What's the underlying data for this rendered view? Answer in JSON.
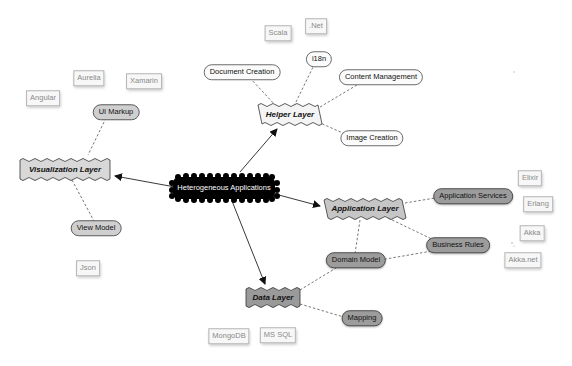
{
  "diagram": {
    "type": "mind-map",
    "center": {
      "label": "Heterogeneous Applications",
      "fill": "#000000",
      "text_color": "#ffffff"
    },
    "layers": [
      {
        "id": "helper",
        "label": "Helper Layer",
        "fill": "#f4f4f4"
      },
      {
        "id": "visualization",
        "label": "Visualization Layer",
        "fill": "#d8d8d8"
      },
      {
        "id": "application",
        "label": "Application Layer",
        "fill": "#c6c6c6"
      },
      {
        "id": "data",
        "label": "Data Layer",
        "fill": "#9a9a9a"
      }
    ],
    "concepts": {
      "document_creation": "Document Creation",
      "i18n": "i18n",
      "content_management": "Content Management",
      "image_creation": "Image Creation",
      "ui_markup": "UI Markup",
      "view_model": "View Model",
      "application_services": "Application Services",
      "business_rules": "Business Rules",
      "domain_model": "Domain Model",
      "mapping": "Mapping"
    },
    "technologies": {
      "scala": "Scala",
      "net": ".Net",
      "aurelia": "Aurelia",
      "xamarin": "Xamarin",
      "angular": "Angular",
      "json": "Json",
      "elixir": "Elixir",
      "erlang": "Erlang",
      "akka": "Akka",
      "akka_net": "Akka.net",
      "mongodb": "MongoDB",
      "ms_sql": "MS SQL"
    },
    "edges": [
      {
        "from": "Heterogeneous Applications",
        "to": "Helper Layer",
        "style": "solid-arrow"
      },
      {
        "from": "Heterogeneous Applications",
        "to": "Visualization Layer",
        "style": "solid-arrow"
      },
      {
        "from": "Heterogeneous Applications",
        "to": "Application Layer",
        "style": "solid-arrow"
      },
      {
        "from": "Heterogeneous Applications",
        "to": "Data Layer",
        "style": "solid-arrow"
      },
      {
        "from": "Helper Layer",
        "to": "Document Creation",
        "style": "dashed"
      },
      {
        "from": "Helper Layer",
        "to": "i18n",
        "style": "dashed"
      },
      {
        "from": "Helper Layer",
        "to": "Content Management",
        "style": "dashed"
      },
      {
        "from": "Helper Layer",
        "to": "Image Creation",
        "style": "dashed"
      },
      {
        "from": "Visualization Layer",
        "to": "UI Markup",
        "style": "dashed"
      },
      {
        "from": "Visualization Layer",
        "to": "View Model",
        "style": "dashed"
      },
      {
        "from": "Application Layer",
        "to": "Application Services",
        "style": "dashed"
      },
      {
        "from": "Application Layer",
        "to": "Business Rules",
        "style": "dashed"
      },
      {
        "from": "Application Layer",
        "to": "Domain Model",
        "style": "dashed"
      },
      {
        "from": "Domain Model",
        "to": "Business Rules",
        "style": "dashed"
      },
      {
        "from": "Data Layer",
        "to": "Domain Model",
        "style": "dashed"
      },
      {
        "from": "Data Layer",
        "to": "Mapping",
        "style": "dashed"
      }
    ]
  }
}
